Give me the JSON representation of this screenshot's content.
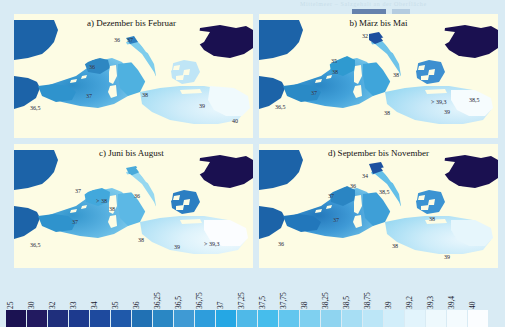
{
  "figure": {
    "caption_remnant": "Mittelmeer – Salzgehalt an der Oberfläche",
    "background_color": "#d9ebf4",
    "land_color": "#fdfce4",
    "atlantic_color": "#1c63a8",
    "blacksea_color": "#1a1050"
  },
  "panels": [
    {
      "id": "a",
      "title": "a) Dezember bis Februar",
      "labels": [
        {
          "text": "36",
          "x": 100,
          "y": 23
        },
        {
          "text": "37",
          "x": 113,
          "y": 23
        },
        {
          "text": "36",
          "x": 75,
          "y": 50
        },
        {
          "text": "37",
          "x": 72,
          "y": 79
        },
        {
          "text": "36,5",
          "x": 16,
          "y": 91
        },
        {
          "text": "38",
          "x": 128,
          "y": 78
        },
        {
          "text": "39",
          "x": 185,
          "y": 89
        },
        {
          "text": "40",
          "x": 218,
          "y": 104
        }
      ]
    },
    {
      "id": "b",
      "title": "b) März bis Mai",
      "labels": [
        {
          "text": "32",
          "x": 103,
          "y": 19
        },
        {
          "text": "35",
          "x": 72,
          "y": 44
        },
        {
          "text": "38",
          "x": 73,
          "y": 55
        },
        {
          "text": "38",
          "x": 134,
          "y": 58
        },
        {
          "text": "37",
          "x": 52,
          "y": 76
        },
        {
          "text": "36,5",
          "x": 16,
          "y": 90
        },
        {
          "text": "38",
          "x": 125,
          "y": 96
        },
        {
          "text": "> 39,3",
          "x": 178,
          "y": 85
        },
        {
          "text": "39",
          "x": 185,
          "y": 95
        },
        {
          "text": "38,5",
          "x": 210,
          "y": 83
        }
      ]
    },
    {
      "id": "c",
      "title": "c) Juni bis August",
      "labels": [
        {
          "text": "37",
          "x": 61,
          "y": 44
        },
        {
          "text": "> 38",
          "x": 86,
          "y": 54
        },
        {
          "text": "38",
          "x": 97,
          "y": 62
        },
        {
          "text": "36",
          "x": 122,
          "y": 49
        },
        {
          "text": "37",
          "x": 58,
          "y": 75
        },
        {
          "text": "36,5",
          "x": 16,
          "y": 98
        },
        {
          "text": "38",
          "x": 124,
          "y": 93
        },
        {
          "text": "39",
          "x": 160,
          "y": 100
        },
        {
          "text": "> 39,3",
          "x": 196,
          "y": 97
        }
      ]
    },
    {
      "id": "d",
      "title": "d) September bis November",
      "labels": [
        {
          "text": "34",
          "x": 103,
          "y": 29
        },
        {
          "text": "36",
          "x": 91,
          "y": 39
        },
        {
          "text": "37",
          "x": 69,
          "y": 49
        },
        {
          "text": "38,5",
          "x": 124,
          "y": 45
        },
        {
          "text": "37",
          "x": 74,
          "y": 73
        },
        {
          "text": "38",
          "x": 170,
          "y": 72
        },
        {
          "text": "36",
          "x": 19,
          "y": 97
        },
        {
          "text": "38",
          "x": 133,
          "y": 99
        },
        {
          "text": "39",
          "x": 185,
          "y": 110
        }
      ]
    }
  ],
  "legend": {
    "ticks": [
      "25",
      "30",
      "32",
      "33",
      "34",
      "35",
      "36",
      "36,25",
      "36,5",
      "36,75",
      "37",
      "37,25",
      "37,5",
      "37,75",
      "38",
      "38,25",
      "38,5",
      "38,75",
      "39",
      "39,2",
      "39,3",
      "39,4",
      "40"
    ],
    "colors": [
      "#1b1252",
      "#221a60",
      "#1f2f7c",
      "#1d3a8e",
      "#1e4a9e",
      "#1f59aa",
      "#2171b4",
      "#2a87c4",
      "#3f9ad4",
      "#2e9ddc",
      "#25a7e4",
      "#4fb9e8",
      "#46bdec",
      "#62c6ee",
      "#7fd0f0",
      "#8fd4f0",
      "#a7def4",
      "#bce6f7",
      "#d2eefa",
      "#e2f4fc",
      "#eef9fd",
      "#f4fbfe",
      "#fbfdff"
    ]
  },
  "chart_data": {
    "type": "heatmap",
    "units": "PSU",
    "panel_titles": [
      "a) Dezember bis Februar",
      "b) März bis Mai",
      "c) Juni bis August",
      "d) September bis November"
    ],
    "colorbar_ticks": [
      25,
      30,
      32,
      33,
      34,
      35,
      36,
      36.25,
      36.5,
      36.75,
      37,
      37.25,
      37.5,
      37.75,
      38,
      38.25,
      38.5,
      38.75,
      39,
      39.2,
      39.3,
      39.4,
      40
    ],
    "colorbar_labels": [
      "25",
      "30",
      "32",
      "33",
      "34",
      "35",
      "36",
      "36,25",
      "36,5",
      "36,75",
      "37",
      "37,25",
      "37,5",
      "37,75",
      "38",
      "38,25",
      "38,5",
      "38,75",
      "39",
      "39,2",
      "39,3",
      "39,4",
      "40"
    ],
    "annotated_values": {
      "a_dezember_bis_februar": [
        36,
        37,
        36,
        37,
        36.5,
        38,
        39,
        40
      ],
      "b_maerz_bis_mai": [
        32,
        35,
        38,
        38,
        37,
        36.5,
        38,
        39.3,
        39,
        38.5
      ],
      "c_juni_bis_august": [
        37,
        38,
        38,
        36,
        37,
        36.5,
        38,
        39,
        39.3
      ],
      "d_september_bis_november": [
        34,
        36,
        37,
        38.5,
        37,
        38,
        36,
        38,
        39
      ]
    },
    "legend_position": "bottom",
    "grid": false
  }
}
